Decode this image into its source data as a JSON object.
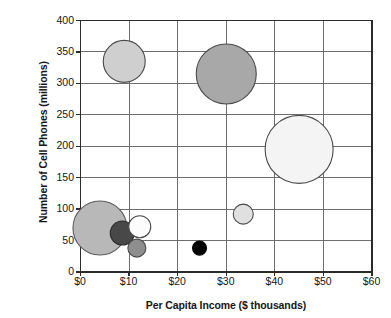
{
  "chart_data": {
    "type": "scatter",
    "title": "",
    "xlabel": "Per Capita Income ($ thousands)",
    "ylabel": "Number of Cell Phones (millions)",
    "xlim": [
      0,
      60
    ],
    "ylim": [
      0,
      400
    ],
    "xticks": [
      "$0",
      "$10",
      "$20",
      "$30",
      "$40",
      "$50",
      "$60"
    ],
    "xtick_values": [
      0,
      10,
      20,
      30,
      40,
      50,
      60
    ],
    "yticks": [
      "0",
      "50",
      "100",
      "150",
      "200",
      "250",
      "300",
      "350",
      "400"
    ],
    "ytick_values": [
      0,
      50,
      100,
      150,
      200,
      250,
      300,
      350,
      400
    ],
    "grid": true,
    "legend": "none",
    "marker_shape": "circle",
    "points": [
      {
        "name": "bubble-light-gray-upper-left",
        "x": 9.0,
        "y": 335,
        "r_px": 21,
        "fill": "#cfcfcf",
        "stroke": "#4a4a4a"
      },
      {
        "name": "bubble-medium-gray-upper-center",
        "x": 30.0,
        "y": 315,
        "r_px": 30,
        "fill": "#a8a8a8",
        "stroke": "#4a4a4a"
      },
      {
        "name": "bubble-white-large-right",
        "x": 45.0,
        "y": 195,
        "r_px": 34,
        "fill": "#f4f4f4",
        "stroke": "#4a4a4a"
      },
      {
        "name": "bubble-light-small-center-right",
        "x": 33.5,
        "y": 92,
        "r_px": 10,
        "fill": "#e0e0e0",
        "stroke": "#4a4a4a"
      },
      {
        "name": "bubble-gray-large-lower-left",
        "x": 4.0,
        "y": 70,
        "r_px": 27,
        "fill": "#b8b8b8",
        "stroke": "#5a5a5a"
      },
      {
        "name": "bubble-dark-gray-lower-left",
        "x": 8.6,
        "y": 62,
        "r_px": 12,
        "fill": "#484848",
        "stroke": "#2a2a2a"
      },
      {
        "name": "bubble-white-lower-left",
        "x": 12.2,
        "y": 72,
        "r_px": 11,
        "fill": "#fcfcfc",
        "stroke": "#4a4a4a"
      },
      {
        "name": "bubble-medium-gray-bottom-left",
        "x": 11.6,
        "y": 38,
        "r_px": 9,
        "fill": "#8e8e8e",
        "stroke": "#4a4a4a"
      },
      {
        "name": "bubble-black-bottom-center",
        "x": 24.5,
        "y": 38,
        "r_px": 7,
        "fill": "#050505",
        "stroke": "#050505"
      }
    ],
    "colors": {
      "axis": "#2b2b2b",
      "grid": "#6e6e6e",
      "text": "#161616",
      "background": "#ffffff"
    }
  }
}
